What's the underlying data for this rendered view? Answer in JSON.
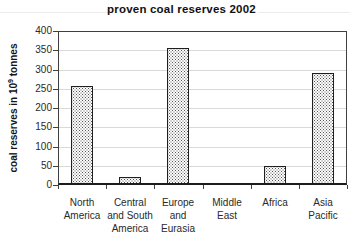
{
  "chart_data": {
    "type": "bar",
    "title": "proven coal reserves 2002",
    "categories": [
      "North America",
      "Central and South America",
      "Europe and Eurasia",
      "Middle East",
      "Africa",
      "Asia Pacific"
    ],
    "category_lines": [
      "North\nAmerica",
      "Central\nand South\nAmerica",
      "Europe\nand\nEurasia",
      "Middle\nEast",
      "Africa",
      "Asia\nPacific"
    ],
    "values": [
      258,
      20,
      355,
      5,
      50,
      290
    ],
    "xlabel": "",
    "ylabel": "coal reserves in 10⁹ tonnes",
    "ylabel_parts": {
      "base": "coal reserves in 10",
      "sup": "9",
      "rest": " tonnes"
    },
    "ylim": [
      0,
      400
    ],
    "ytick_step": 50,
    "yticks": [
      0,
      50,
      100,
      150,
      200,
      250,
      300,
      350,
      400
    ],
    "grid": true,
    "legend": "none",
    "bar_fill": "dotted-pattern",
    "colors": {
      "background": "#ffffff",
      "bar_face": "#fdfdfd",
      "bar_dot": "#373737",
      "bar_border": "#1f1f1f",
      "grid": "#d9d9d9",
      "axis": "#3f3f3f",
      "text": "#2a2a2a",
      "title": "#111111"
    }
  }
}
